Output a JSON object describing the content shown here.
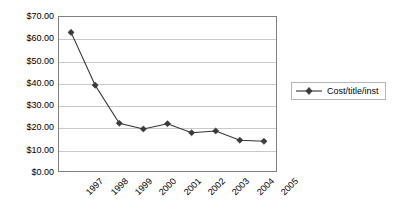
{
  "chart_data": {
    "type": "line",
    "title": "",
    "xlabel": "",
    "ylabel": "",
    "categories": [
      "1997",
      "1998",
      "1999",
      "2000",
      "2001",
      "2002",
      "2003",
      "2004",
      "2005"
    ],
    "series": [
      {
        "name": "Cost/title/inst",
        "values": [
          63.0,
          39.0,
          21.7,
          19.1,
          21.5,
          17.4,
          18.2,
          14.0,
          13.5
        ],
        "marker": "diamond",
        "color": "#333333"
      }
    ],
    "ylim": [
      0,
      70
    ],
    "ytick_step": 10,
    "ytick_labels": [
      "$0.00",
      "$10.00",
      "$20.00",
      "$30.00",
      "$40.00",
      "$50.00",
      "$60.00",
      "$70.00"
    ],
    "ytick_values": [
      0,
      10,
      20,
      30,
      40,
      50,
      60,
      70
    ],
    "grid": true,
    "grid_axis": "y",
    "legend_position": "right",
    "legend_entries": [
      "Cost/title/inst"
    ],
    "xtick_rotation": -45
  }
}
